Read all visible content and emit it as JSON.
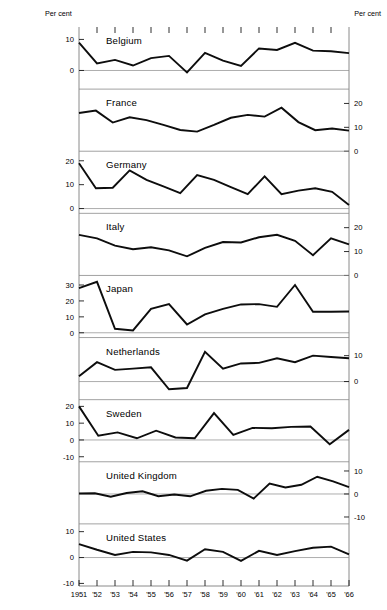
{
  "header": {
    "left_label": "Per cent",
    "right_label": "Per cent"
  },
  "axis": {
    "year_labels": [
      "1951",
      "'52",
      "'53",
      "'54",
      "'55",
      "'56",
      "'57",
      "'58",
      "'59",
      "'60",
      "'61",
      "'62",
      "'63",
      "'64",
      "'65",
      "'66"
    ]
  },
  "colors": {
    "line": "#0d0d0d",
    "zero_line": "#8a8a8a",
    "frame": "#7d7d7d",
    "background": "#ffffff"
  },
  "panels": [
    {
      "name": "Belgium",
      "label_side": "left",
      "ticks": [
        10,
        0
      ],
      "ylim": [
        -6,
        14
      ],
      "values": [
        9.0,
        2.3,
        3.4,
        1.6,
        4.0,
        4.7,
        -0.6,
        5.7,
        3.2,
        1.5,
        7.1,
        6.6,
        8.9,
        6.4,
        6.2,
        5.6
      ]
    },
    {
      "name": "France",
      "label_side": "right",
      "ticks": [
        20,
        10,
        0
      ],
      "ylim": [
        0,
        26
      ],
      "values": [
        16.0,
        17.0,
        12.0,
        14.2,
        13.0,
        11.0,
        8.9,
        8.2,
        11.0,
        14.0,
        15.2,
        14.5,
        18.2,
        12.2,
        8.8,
        9.5,
        8.6
      ]
    },
    {
      "name": "Germany",
      "label_side": "left",
      "ticks": [
        20,
        10,
        0
      ],
      "ylim": [
        -2,
        24
      ],
      "values": [
        19.0,
        8.5,
        8.7,
        16.0,
        12.0,
        9.3,
        6.5,
        14.0,
        12.0,
        9.0,
        6.0,
        13.5,
        6.0,
        7.5,
        8.5,
        7.0,
        1.5
      ]
    },
    {
      "name": "Italy",
      "label_side": "right",
      "ticks": [
        20,
        10,
        0
      ],
      "ylim": [
        0,
        26
      ],
      "values": [
        17.0,
        15.5,
        12.5,
        11.0,
        11.8,
        10.5,
        8.0,
        11.5,
        14.0,
        13.8,
        16.0,
        17.0,
        14.5,
        8.5,
        15.5,
        13.0
      ]
    },
    {
      "name": "Japan",
      "label_side": "left",
      "ticks": [
        30,
        20,
        10,
        0
      ],
      "ylim": [
        -3,
        36
      ],
      "values": [
        28.0,
        32.0,
        2.5,
        1.5,
        15.0,
        18.0,
        5.2,
        11.5,
        15.0,
        17.8,
        18.0,
        16.3,
        30.0,
        13.2,
        13.2,
        13.4
      ]
    },
    {
      "name": "Netherlands",
      "label_side": "right",
      "ticks": [
        20,
        10,
        0,
        -10
      ],
      "ylim": [
        -7,
        17
      ],
      "values": [
        2.0,
        7.5,
        4.5,
        5.0,
        5.5,
        -3.0,
        -2.5,
        11.5,
        5.0,
        7.0,
        7.2,
        9.0,
        7.5,
        10.0,
        9.5,
        9.0
      ]
    },
    {
      "name": "Sweden",
      "label_side": "left",
      "ticks": [
        20,
        10,
        0,
        -10
      ],
      "ylim": [
        -13,
        24
      ],
      "values": [
        20.0,
        2.5,
        4.5,
        1.0,
        5.5,
        1.5,
        1.0,
        16.0,
        3.0,
        7.2,
        7.0,
        7.8,
        8.0,
        -2.5,
        6.0
      ]
    },
    {
      "name": "United Kingdom",
      "label_side": "right",
      "ticks": [
        10,
        0,
        -10
      ],
      "ylim": [
        -13,
        14
      ],
      "values": [
        0.2,
        0.3,
        -1.2,
        0.4,
        1.2,
        -1.0,
        -0.2,
        -1.0,
        1.4,
        2.2,
        1.8,
        -2.0,
        4.5,
        2.8,
        4.0,
        7.5,
        5.5,
        3.0
      ]
    },
    {
      "name": "United States",
      "label_side": "left",
      "ticks": [
        10,
        0,
        -10
      ],
      "ylim": [
        -11,
        13
      ],
      "values": [
        5.2,
        3.0,
        1.0,
        2.2,
        2.0,
        1.0,
        -1.2,
        3.2,
        2.2,
        -1.3,
        2.6,
        1.0,
        2.5,
        3.8,
        4.2,
        1.2
      ]
    }
  ],
  "chart_data": {
    "type": "line",
    "title": "",
    "subtitle": "",
    "xlabel": "",
    "ylabel": "Per cent",
    "grid": false,
    "legend": "none",
    "layout": "9 stacked panels sharing a common year axis",
    "x": [
      "1951",
      "1952",
      "1953",
      "1954",
      "1955",
      "1956",
      "1957",
      "1958",
      "1959",
      "1960",
      "1961",
      "1962",
      "1963",
      "1964",
      "1965",
      "1966"
    ],
    "series": [
      {
        "name": "Belgium",
        "values": [
          9.0,
          2.3,
          3.4,
          1.6,
          4.0,
          4.7,
          -0.6,
          5.7,
          3.2,
          1.5,
          7.1,
          6.6,
          8.9,
          6.4,
          6.2,
          5.6
        ],
        "ylim": [
          -6,
          14
        ],
        "yticks": [
          10,
          0
        ]
      },
      {
        "name": "France",
        "values": [
          16.0,
          17.0,
          12.0,
          14.2,
          13.0,
          11.0,
          8.9,
          8.2,
          11.0,
          14.0,
          15.2,
          14.5,
          18.2,
          12.2,
          8.8,
          9.0
        ],
        "ylim": [
          0,
          26
        ],
        "yticks": [
          20,
          10,
          0
        ]
      },
      {
        "name": "Germany",
        "values": [
          19.0,
          8.5,
          8.7,
          16.0,
          12.0,
          9.3,
          6.5,
          14.0,
          12.0,
          9.0,
          6.0,
          13.5,
          6.0,
          7.5,
          8.5,
          1.5
        ],
        "ylim": [
          -2,
          24
        ],
        "yticks": [
          20,
          10,
          0
        ]
      },
      {
        "name": "Italy",
        "values": [
          17.0,
          15.5,
          12.5,
          11.0,
          11.8,
          10.5,
          8.0,
          11.5,
          14.0,
          13.8,
          16.0,
          17.0,
          14.5,
          8.5,
          15.5,
          13.0
        ],
        "ylim": [
          0,
          26
        ],
        "yticks": [
          20,
          10,
          0
        ]
      },
      {
        "name": "Japan",
        "values": [
          28.0,
          32.0,
          2.5,
          1.5,
          15.0,
          18.0,
          5.2,
          11.5,
          15.0,
          17.8,
          18.0,
          16.3,
          30.0,
          13.2,
          13.2,
          13.4
        ],
        "ylim": [
          -3,
          36
        ],
        "yticks": [
          30,
          20,
          10,
          0
        ]
      },
      {
        "name": "Netherlands",
        "values": [
          2.0,
          7.5,
          4.5,
          5.0,
          5.5,
          -3.0,
          -2.5,
          11.5,
          5.0,
          7.0,
          7.2,
          9.0,
          7.5,
          10.0,
          9.5,
          9.0
        ],
        "ylim": [
          -7,
          17
        ],
        "yticks": [
          20,
          10,
          0,
          -10
        ]
      },
      {
        "name": "Sweden",
        "values": [
          20.0,
          2.5,
          4.5,
          1.0,
          5.5,
          1.5,
          1.0,
          16.0,
          3.0,
          7.2,
          7.0,
          7.8,
          8.0,
          -2.5,
          6.0,
          6.0
        ],
        "ylim": [
          -13,
          24
        ],
        "yticks": [
          20,
          10,
          0,
          -10
        ]
      },
      {
        "name": "United Kingdom",
        "values": [
          0.2,
          0.3,
          -1.2,
          0.4,
          1.2,
          -1.0,
          -0.2,
          1.4,
          2.2,
          1.8,
          -2.0,
          4.5,
          2.8,
          4.0,
          7.5,
          3.0
        ],
        "ylim": [
          -13,
          14
        ],
        "yticks": [
          10,
          0,
          -10
        ]
      },
      {
        "name": "United States",
        "values": [
          5.2,
          3.0,
          1.0,
          2.2,
          2.0,
          1.0,
          -1.2,
          3.2,
          2.2,
          -1.3,
          2.6,
          1.0,
          2.5,
          3.8,
          4.2,
          1.2
        ],
        "ylim": [
          -11,
          13
        ],
        "yticks": [
          10,
          0,
          -10
        ]
      }
    ]
  }
}
